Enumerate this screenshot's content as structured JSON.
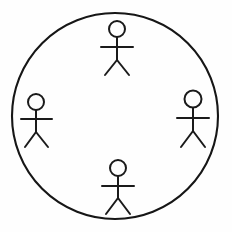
{
  "scene": {
    "title": "Circle with four stick figures",
    "description": "A large hand-drawn circle outline containing four stick-figure people arranged at the top, left, right and bottom of the circle, each facing outward from the centre.",
    "canvas": {
      "width": 232,
      "height": 232,
      "background_color": "#fefefe"
    },
    "stroke_color": "#1a1a1a",
    "fill_color": "none"
  },
  "boundary": {
    "name": "circle",
    "shape": "circle",
    "center_x": 115,
    "center_y": 116,
    "radius": 103,
    "stroke_width": 2.1,
    "stroke_color": "#161616",
    "fill": "none"
  },
  "figures": [
    {
      "id": "figure-top",
      "label": "Top figure",
      "position": "top",
      "head": {
        "cx": 117,
        "cy": 29,
        "r": 8
      },
      "body": {
        "x1": 117,
        "y1": 37,
        "x2": 117,
        "y2": 60
      },
      "arms": {
        "x1": 101,
        "y1": 47,
        "x2": 133,
        "y2": 47
      },
      "leg_left": {
        "x1": 117,
        "y1": 60,
        "x2": 105,
        "y2": 75
      },
      "leg_right": {
        "x1": 117,
        "y1": 60,
        "x2": 129,
        "y2": 75
      }
    },
    {
      "id": "figure-left",
      "label": "Left figure",
      "position": "left",
      "head": {
        "cx": 36,
        "cy": 102,
        "r": 8
      },
      "body": {
        "x1": 36,
        "y1": 110,
        "x2": 36,
        "y2": 132
      },
      "arms": {
        "x1": 21,
        "y1": 119,
        "x2": 52,
        "y2": 119
      },
      "leg_left": {
        "x1": 36,
        "y1": 132,
        "x2": 25,
        "y2": 147
      },
      "leg_right": {
        "x1": 36,
        "y1": 132,
        "x2": 48,
        "y2": 147
      }
    },
    {
      "id": "figure-right",
      "label": "Right figure",
      "position": "right",
      "head": {
        "cx": 193,
        "cy": 99,
        "r": 8.5
      },
      "body": {
        "x1": 193,
        "y1": 108,
        "x2": 193,
        "y2": 131
      },
      "arms": {
        "x1": 177,
        "y1": 118,
        "x2": 209,
        "y2": 118
      },
      "leg_left": {
        "x1": 193,
        "y1": 131,
        "x2": 181,
        "y2": 147
      },
      "leg_right": {
        "x1": 193,
        "y1": 131,
        "x2": 205,
        "y2": 147
      }
    },
    {
      "id": "figure-bottom",
      "label": "Bottom figure",
      "position": "bottom",
      "head": {
        "cx": 118,
        "cy": 168,
        "r": 8
      },
      "body": {
        "x1": 118,
        "y1": 176,
        "x2": 118,
        "y2": 198
      },
      "arms": {
        "x1": 102,
        "y1": 186,
        "x2": 134,
        "y2": 186
      },
      "leg_left": {
        "x1": 118,
        "y1": 198,
        "x2": 106,
        "y2": 214
      },
      "leg_right": {
        "x1": 118,
        "y1": 198,
        "x2": 130,
        "y2": 214
      }
    }
  ]
}
